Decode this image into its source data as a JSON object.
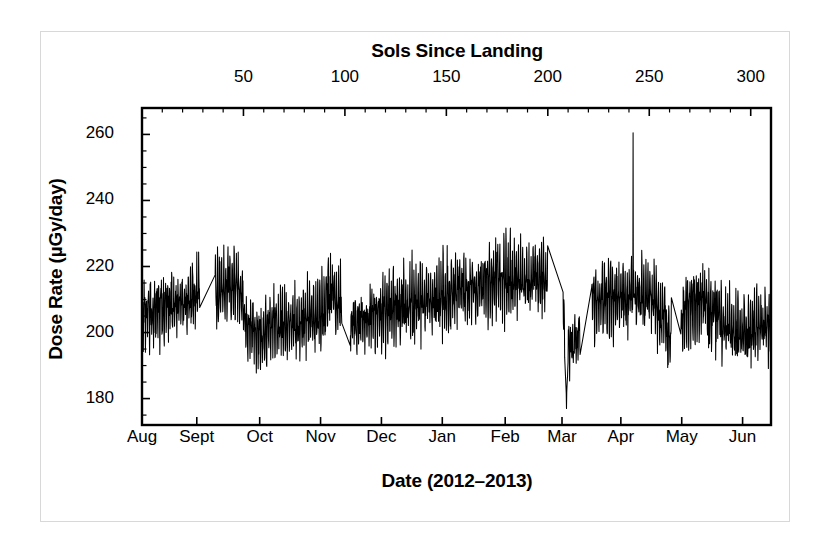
{
  "figure": {
    "top_axis_title": "Sols Since Landing",
    "bottom_axis_title": "Date (2012–2013)",
    "left_axis_title": "Dose Rate (µGy/day)",
    "line_color": "#000000",
    "frame_color": "#000000",
    "background": "#ffffff"
  },
  "chart_data": {
    "type": "line",
    "title": "",
    "subtitle": "",
    "xlabel": "Date (2012–2013)",
    "xlabel_top": "Sols Since Landing",
    "ylabel": "Dose Rate (µGy/day)",
    "grid": false,
    "legend": false,
    "legend_position": "none",
    "ylim": [
      172,
      268
    ],
    "yticks": [
      180,
      200,
      220,
      240,
      260
    ],
    "ytick_labels": [
      "180",
      "200",
      "220",
      "240",
      "260"
    ],
    "y_minor_tick_step": 5,
    "xlim_sols": [
      0,
      310
    ],
    "xticks_top": [
      50,
      100,
      150,
      200,
      250,
      300
    ],
    "xtick_labels_top": [
      "50",
      "100",
      "150",
      "200",
      "250",
      "300"
    ],
    "xticks_bottom_months": [
      "Aug",
      "Sept",
      "Oct",
      "Nov",
      "Dec",
      "Jan",
      "Feb",
      "Mar",
      "Apr",
      "May",
      "Jun"
    ],
    "x_month_sols": [
      0,
      27,
      58,
      88,
      118,
      148,
      179,
      207,
      236,
      266,
      296
    ],
    "series_name": "RAD surface dose rate",
    "units": "µGy/day",
    "n_points": 2400,
    "notes": [
      "Dense high-frequency diurnal oscillation, amplitude roughly ±8–12 µGy/day about a slowly drifting baseline",
      "Data gaps bridged by straight interpolating segments",
      "Large single spike near sol 242 (early April) reaching about 260 µGy/day",
      "Sharp dropout to about 177 µGy/day at the start of March (near sol 209)"
    ],
    "baseline_control_points": [
      {
        "sol": 0,
        "value": 205
      },
      {
        "sol": 8,
        "value": 206
      },
      {
        "sol": 16,
        "value": 208
      },
      {
        "sol": 22,
        "value": 209
      },
      {
        "sol": 27,
        "value": 211
      },
      {
        "sol": 32,
        "value": 209
      },
      {
        "sol": 38,
        "value": 212
      },
      {
        "sol": 43,
        "value": 215
      },
      {
        "sol": 48,
        "value": 213
      },
      {
        "sol": 52,
        "value": 201
      },
      {
        "sol": 58,
        "value": 200
      },
      {
        "sol": 66,
        "value": 202
      },
      {
        "sol": 74,
        "value": 203
      },
      {
        "sol": 82,
        "value": 204
      },
      {
        "sol": 88,
        "value": 206
      },
      {
        "sol": 93,
        "value": 212
      },
      {
        "sol": 97,
        "value": 209
      },
      {
        "sol": 101,
        "value": 200
      },
      {
        "sol": 108,
        "value": 203
      },
      {
        "sol": 116,
        "value": 206
      },
      {
        "sol": 124,
        "value": 207
      },
      {
        "sol": 132,
        "value": 209
      },
      {
        "sol": 140,
        "value": 210
      },
      {
        "sol": 148,
        "value": 211
      },
      {
        "sol": 156,
        "value": 213
      },
      {
        "sol": 164,
        "value": 214
      },
      {
        "sol": 172,
        "value": 215
      },
      {
        "sol": 180,
        "value": 216
      },
      {
        "sol": 188,
        "value": 216
      },
      {
        "sol": 196,
        "value": 217
      },
      {
        "sol": 203,
        "value": 216
      },
      {
        "sol": 207,
        "value": 215
      },
      {
        "sol": 209,
        "value": 196
      },
      {
        "sol": 212,
        "value": 197
      },
      {
        "sol": 216,
        "value": 199
      },
      {
        "sol": 220,
        "value": 208
      },
      {
        "sol": 226,
        "value": 209
      },
      {
        "sol": 232,
        "value": 210
      },
      {
        "sol": 238,
        "value": 211
      },
      {
        "sol": 244,
        "value": 212
      },
      {
        "sol": 250,
        "value": 211
      },
      {
        "sol": 256,
        "value": 207
      },
      {
        "sol": 260,
        "value": 197
      },
      {
        "sol": 264,
        "value": 200
      },
      {
        "sol": 270,
        "value": 208
      },
      {
        "sol": 276,
        "value": 210
      },
      {
        "sol": 282,
        "value": 206
      },
      {
        "sol": 288,
        "value": 202
      },
      {
        "sol": 294,
        "value": 200
      },
      {
        "sol": 300,
        "value": 201
      },
      {
        "sol": 306,
        "value": 203
      },
      {
        "sol": 310,
        "value": 202
      }
    ],
    "gaps": [
      {
        "start_sol": 28.5,
        "end_sol": 36.0
      },
      {
        "start_sol": 98.5,
        "end_sol": 102.5
      },
      {
        "start_sol": 200.0,
        "end_sol": 207.5
      },
      {
        "start_sol": 216.0,
        "end_sol": 221.5
      },
      {
        "start_sol": 261.0,
        "end_sol": 265.5
      }
    ],
    "spike": {
      "sol": 242,
      "value": 260.5
    },
    "dropout": {
      "sol": 209.2,
      "value": 177
    }
  }
}
